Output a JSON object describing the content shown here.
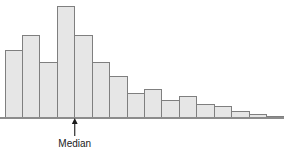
{
  "chart_data": {
    "type": "bar",
    "title": "",
    "subtitle": "",
    "xlabel": "",
    "ylabel": "",
    "grid": false,
    "legend": null,
    "axis": {
      "x_axis_visible": true,
      "y_axis_visible": false,
      "x_tick_labels": [],
      "y_tick_labels": [],
      "ylim": [
        0,
        120
      ]
    },
    "categories": [
      "1",
      "2",
      "3",
      "4",
      "5",
      "6",
      "7",
      "8",
      "9",
      "10",
      "11",
      "12",
      "13",
      "14",
      "15",
      "16"
    ],
    "values": [
      70,
      85,
      57,
      115,
      85,
      57,
      43,
      25,
      29,
      18,
      22,
      14,
      11,
      6,
      3,
      1
    ],
    "bar_fill_color": "#e6e6e6",
    "bar_edge_color": "#7f7f7f",
    "axis_color": "#8c8c8c",
    "annotations": [
      {
        "name": "median-marker",
        "label": "Median",
        "type": "arrow-up-with-label",
        "x_category_boundary": 4,
        "arrow_color": "#1a1a1a",
        "label_color": "#1a1a1a"
      }
    ]
  },
  "figure": {
    "width": 284,
    "height": 150,
    "background": "#ffffff"
  }
}
